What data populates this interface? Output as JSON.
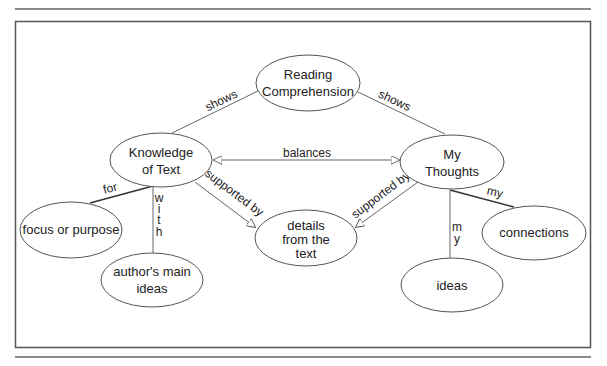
{
  "diagram": {
    "nodes": {
      "reading_comprehension": {
        "line1": "Reading",
        "line2": "Comprehension"
      },
      "knowledge_of_text": {
        "line1": "Knowledge",
        "line2": "of Text"
      },
      "my_thoughts": {
        "line1": "My",
        "line2": "Thoughts"
      },
      "details_from_text": {
        "line1": "details",
        "line2": "from the",
        "line3": "text"
      },
      "focus_or_purpose": {
        "line1": "focus or purpose"
      },
      "authors_main_ideas": {
        "line1": "author's main",
        "line2": "ideas"
      },
      "connections": {
        "line1": "connections"
      },
      "ideas": {
        "line1": "ideas"
      }
    },
    "edges": {
      "rc_to_knowledge": "shows",
      "rc_to_thoughts": "shows",
      "balances": "balances",
      "knowledge_supported": "supported by",
      "thoughts_supported": "supported by",
      "knowledge_for": "for",
      "knowledge_with": [
        "w",
        "i",
        "t",
        "h"
      ],
      "thoughts_my_connections": "my",
      "thoughts_my_ideas": [
        "m",
        "y"
      ]
    },
    "colors": {
      "line": "#666666",
      "node_border": "#555555",
      "text": "#222222"
    }
  }
}
